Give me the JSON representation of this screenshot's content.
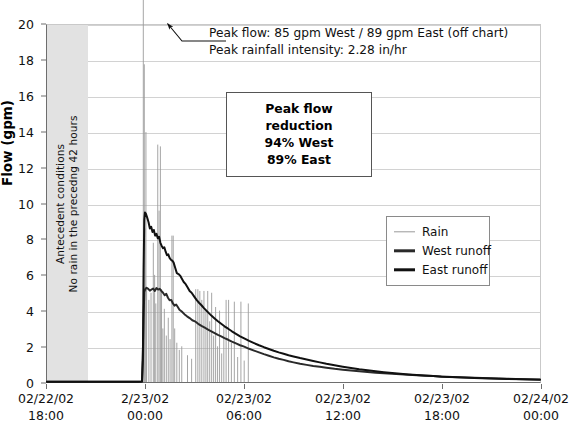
{
  "chart_data": {
    "type": "line",
    "title": "",
    "xlabel": "",
    "ylabel": "Flow (gpm)",
    "ylim": [
      0,
      20
    ],
    "ytick_labels": [
      "20",
      "18",
      "16",
      "14",
      "12",
      "10",
      "8",
      "6",
      "4",
      "2",
      "0"
    ],
    "ytick_values": [
      20,
      18,
      16,
      14,
      12,
      10,
      8,
      6,
      4,
      2,
      0
    ],
    "grid": true,
    "legend_position": "center-right",
    "xtick_labels": [
      {
        "date": "02/22/02",
        "time": "18:00"
      },
      {
        "date": "2/23/02",
        "time": "00:00"
      },
      {
        "date": "02/23/02",
        "time": "06:00"
      },
      {
        "date": "02/23/02",
        "time": "12:00"
      },
      {
        "date": "02/23/02",
        "time": "18:00"
      },
      {
        "date": "02/24/02",
        "time": "00:00"
      }
    ],
    "xlim_hours": [
      0,
      30
    ],
    "xtick_hours": [
      0,
      6,
      12,
      18,
      24,
      30
    ],
    "series": [
      {
        "name": "Rain",
        "color": "#9a9a9a",
        "style": "spikes",
        "width": 0.9,
        "spikes": [
          [
            5.86,
            22.5
          ],
          [
            5.92,
            17.8
          ],
          [
            5.97,
            8.6
          ],
          [
            6.02,
            14.0
          ],
          [
            6.06,
            5.2
          ],
          [
            6.2,
            4.6
          ],
          [
            6.33,
            5.0
          ],
          [
            6.47,
            7.8
          ],
          [
            6.55,
            6.0
          ],
          [
            6.62,
            4.4
          ],
          [
            6.74,
            13.3
          ],
          [
            6.82,
            9.6
          ],
          [
            6.9,
            13.2
          ],
          [
            6.97,
            5.2
          ],
          [
            7.05,
            3.0
          ],
          [
            7.14,
            4.1
          ],
          [
            7.26,
            2.6
          ],
          [
            7.38,
            3.6
          ],
          [
            7.49,
            2.4
          ],
          [
            7.6,
            8.2
          ],
          [
            7.68,
            8.2
          ],
          [
            7.77,
            3.0
          ],
          [
            7.9,
            2.2
          ],
          [
            8.05,
            1.8
          ],
          [
            8.2,
            2.0
          ],
          [
            8.55,
            1.5
          ],
          [
            8.8,
            1.3
          ],
          [
            9.05,
            5.2
          ],
          [
            9.18,
            5.2
          ],
          [
            9.3,
            5.1
          ],
          [
            9.42,
            4.6
          ],
          [
            9.55,
            5.1
          ],
          [
            9.67,
            4.0
          ],
          [
            9.78,
            5.1
          ],
          [
            9.9,
            3.4
          ],
          [
            10.02,
            5.0
          ],
          [
            10.14,
            2.6
          ],
          [
            10.26,
            4.2
          ],
          [
            10.38,
            2.0
          ],
          [
            10.5,
            4.0
          ],
          [
            10.63,
            1.6
          ],
          [
            10.76,
            3.1
          ],
          [
            10.9,
            4.6
          ],
          [
            11.05,
            4.6
          ],
          [
            11.22,
            2.2
          ],
          [
            11.4,
            4.5
          ],
          [
            11.6,
            1.4
          ],
          [
            11.8,
            4.5
          ],
          [
            12.0,
            1.2
          ],
          [
            12.25,
            4.4
          ]
        ]
      },
      {
        "name": "West runoff",
        "color": "#2a2a2a",
        "style": "line",
        "width": 2.0,
        "peak_value": 5.3,
        "points": [
          [
            0.0,
            0.02
          ],
          [
            4.8,
            0.02
          ],
          [
            5.6,
            0.02
          ],
          [
            5.78,
            0.03
          ],
          [
            5.84,
            1.2
          ],
          [
            5.88,
            3.6
          ],
          [
            5.92,
            5.05
          ],
          [
            5.98,
            5.2
          ],
          [
            6.06,
            5.28
          ],
          [
            6.16,
            5.22
          ],
          [
            6.26,
            5.12
          ],
          [
            6.36,
            5.18
          ],
          [
            6.46,
            5.24
          ],
          [
            6.56,
            5.1
          ],
          [
            6.66,
            5.26
          ],
          [
            6.76,
            5.18
          ],
          [
            6.86,
            5.22
          ],
          [
            6.96,
            5.1
          ],
          [
            7.06,
            5.0
          ],
          [
            7.16,
            4.86
          ],
          [
            7.26,
            4.94
          ],
          [
            7.36,
            4.72
          ],
          [
            7.46,
            4.58
          ],
          [
            7.56,
            4.6
          ],
          [
            7.66,
            4.4
          ],
          [
            7.76,
            4.28
          ],
          [
            7.86,
            4.34
          ],
          [
            7.96,
            4.2
          ],
          [
            8.06,
            4.05
          ],
          [
            8.2,
            3.95
          ],
          [
            8.36,
            3.8
          ],
          [
            8.52,
            3.68
          ],
          [
            8.68,
            3.58
          ],
          [
            8.84,
            3.46
          ],
          [
            9.0,
            3.4
          ],
          [
            9.2,
            3.26
          ],
          [
            9.4,
            3.14
          ],
          [
            9.6,
            3.04
          ],
          [
            9.8,
            2.94
          ],
          [
            10.0,
            2.84
          ],
          [
            10.2,
            2.74
          ],
          [
            10.4,
            2.64
          ],
          [
            10.6,
            2.56
          ],
          [
            10.8,
            2.46
          ],
          [
            11.0,
            2.38
          ],
          [
            11.25,
            2.26
          ],
          [
            11.5,
            2.16
          ],
          [
            11.75,
            2.06
          ],
          [
            12.0,
            1.98
          ],
          [
            12.3,
            1.86
          ],
          [
            12.6,
            1.76
          ],
          [
            12.9,
            1.66
          ],
          [
            13.2,
            1.56
          ],
          [
            13.5,
            1.47
          ],
          [
            13.8,
            1.38
          ],
          [
            14.1,
            1.3
          ],
          [
            14.4,
            1.24
          ],
          [
            14.7,
            1.16
          ],
          [
            15.0,
            1.1
          ],
          [
            15.4,
            1.02
          ],
          [
            15.8,
            0.96
          ],
          [
            16.2,
            0.9
          ],
          [
            16.6,
            0.85
          ],
          [
            17.0,
            0.8
          ],
          [
            17.5,
            0.74
          ],
          [
            18.0,
            0.69
          ],
          [
            18.5,
            0.64
          ],
          [
            19.0,
            0.6
          ],
          [
            19.5,
            0.56
          ],
          [
            20.0,
            0.52
          ],
          [
            20.5,
            0.49
          ],
          [
            21.0,
            0.46
          ],
          [
            21.5,
            0.43
          ],
          [
            22.0,
            0.4
          ],
          [
            22.5,
            0.38
          ],
          [
            23.0,
            0.35
          ],
          [
            23.5,
            0.33
          ],
          [
            24.0,
            0.31
          ],
          [
            25.0,
            0.27
          ],
          [
            26.0,
            0.24
          ],
          [
            27.0,
            0.21
          ],
          [
            28.0,
            0.18
          ],
          [
            29.0,
            0.16
          ],
          [
            30.0,
            0.14
          ]
        ]
      },
      {
        "name": "East runoff",
        "color": "#111111",
        "style": "line",
        "width": 2.0,
        "peak_value": 9.5,
        "points": [
          [
            0.0,
            0.02
          ],
          [
            4.8,
            0.02
          ],
          [
            5.6,
            0.02
          ],
          [
            5.78,
            0.03
          ],
          [
            5.84,
            2.0
          ],
          [
            5.88,
            6.4
          ],
          [
            5.92,
            9.1
          ],
          [
            5.96,
            9.5
          ],
          [
            6.02,
            9.42
          ],
          [
            6.1,
            9.2
          ],
          [
            6.18,
            8.95
          ],
          [
            6.26,
            8.6
          ],
          [
            6.34,
            8.7
          ],
          [
            6.42,
            8.4
          ],
          [
            6.5,
            8.52
          ],
          [
            6.58,
            8.2
          ],
          [
            6.66,
            8.3
          ],
          [
            6.74,
            8.05
          ],
          [
            6.82,
            8.14
          ],
          [
            6.9,
            7.8
          ],
          [
            6.98,
            7.62
          ],
          [
            7.06,
            7.5
          ],
          [
            7.14,
            7.55
          ],
          [
            7.22,
            7.3
          ],
          [
            7.3,
            7.1
          ],
          [
            7.38,
            7.15
          ],
          [
            7.46,
            6.95
          ],
          [
            7.54,
            6.85
          ],
          [
            7.62,
            6.8
          ],
          [
            7.7,
            6.7
          ],
          [
            7.8,
            6.4
          ],
          [
            7.9,
            6.1
          ],
          [
            8.0,
            6.05
          ],
          [
            8.1,
            5.96
          ],
          [
            8.2,
            5.8
          ],
          [
            8.32,
            5.6
          ],
          [
            8.44,
            5.48
          ],
          [
            8.56,
            5.3
          ],
          [
            8.68,
            5.1
          ],
          [
            8.8,
            5.0
          ],
          [
            8.95,
            4.8
          ],
          [
            9.1,
            4.6
          ],
          [
            9.25,
            4.44
          ],
          [
            9.4,
            4.3
          ],
          [
            9.55,
            4.14
          ],
          [
            9.7,
            4.0
          ],
          [
            9.85,
            3.86
          ],
          [
            10.0,
            3.72
          ],
          [
            10.2,
            3.56
          ],
          [
            10.4,
            3.4
          ],
          [
            10.6,
            3.26
          ],
          [
            10.8,
            3.12
          ],
          [
            11.0,
            3.0
          ],
          [
            11.25,
            2.84
          ],
          [
            11.5,
            2.7
          ],
          [
            11.75,
            2.56
          ],
          [
            12.0,
            2.44
          ],
          [
            12.3,
            2.3
          ],
          [
            12.6,
            2.18
          ],
          [
            12.9,
            2.06
          ],
          [
            13.2,
            1.95
          ],
          [
            13.5,
            1.85
          ],
          [
            13.8,
            1.75
          ],
          [
            14.1,
            1.66
          ],
          [
            14.4,
            1.58
          ],
          [
            14.7,
            1.5
          ],
          [
            15.0,
            1.43
          ],
          [
            15.4,
            1.34
          ],
          [
            15.8,
            1.26
          ],
          [
            16.2,
            1.18
          ],
          [
            16.6,
            1.1
          ],
          [
            17.0,
            1.02
          ],
          [
            17.5,
            0.94
          ],
          [
            18.0,
            0.86
          ],
          [
            18.5,
            0.79
          ],
          [
            19.0,
            0.72
          ],
          [
            19.5,
            0.66
          ],
          [
            20.0,
            0.6
          ],
          [
            20.5,
            0.55
          ],
          [
            21.0,
            0.5
          ],
          [
            21.5,
            0.46
          ],
          [
            22.0,
            0.42
          ],
          [
            22.5,
            0.39
          ],
          [
            23.0,
            0.36
          ],
          [
            23.5,
            0.33
          ],
          [
            24.0,
            0.3
          ],
          [
            25.0,
            0.26
          ],
          [
            26.0,
            0.23
          ],
          [
            27.0,
            0.2
          ],
          [
            28.0,
            0.17
          ],
          [
            29.0,
            0.15
          ],
          [
            30.0,
            0.13
          ]
        ]
      }
    ],
    "annotations": {
      "callout_lines": [
        "Peak flow: 85 gpm West / 89 gpm East (off chart)",
        "Peak rainfall intensity: 2.28 in/hr"
      ],
      "reduction_box": [
        "Peak flow reduction",
        "94% West",
        "89% East"
      ],
      "antecedent_band": [
        "Antecedent conditions",
        "No rain in the precedng 42 hours"
      ]
    }
  },
  "legend": {
    "items": [
      {
        "label": "Rain",
        "color": "#9a9a9a",
        "thickness": "1.4px"
      },
      {
        "label": "West runoff",
        "color": "#2a2a2a",
        "thickness": "3.4px"
      },
      {
        "label": "East runoff",
        "color": "#111111",
        "thickness": "3.4px"
      }
    ]
  },
  "colors": {
    "rain": "#9a9a9a",
    "west": "#2a2a2a",
    "east": "#111111",
    "grid": "#d2d2d2",
    "axis": "#6e6e6e",
    "band": "#e2e2e2"
  }
}
